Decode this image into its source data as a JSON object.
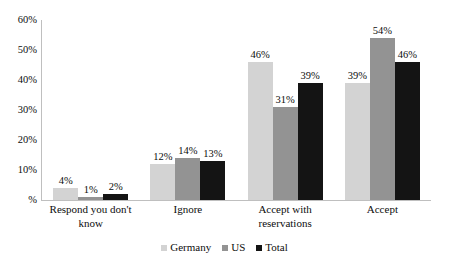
{
  "chart_data": {
    "type": "bar",
    "title": "",
    "subtitle": "",
    "xlabel": "",
    "ylabel": "",
    "ylim": [
      0,
      60
    ],
    "grid": false,
    "legend_position": "bottom",
    "categories": [
      "Respond you don't know",
      "Ignore",
      "Accept with reservations",
      "Accept"
    ],
    "category_lines": [
      [
        "Respond you don't",
        "know"
      ],
      [
        "Ignore"
      ],
      [
        "Accept with",
        "reservations"
      ],
      [
        "Accept"
      ]
    ],
    "y_ticks": [
      "%",
      "10%",
      "20%",
      "30%",
      "40%",
      "50%",
      "60%"
    ],
    "y_tick_values": [
      0,
      10,
      20,
      30,
      40,
      50,
      60
    ],
    "series": [
      {
        "name": "Germany",
        "color": "#d3d3d3",
        "values": [
          4,
          12,
          46,
          39
        ],
        "labels": [
          "4%",
          "12%",
          "46%",
          "39%"
        ]
      },
      {
        "name": "US",
        "color": "#939393",
        "values": [
          1,
          14,
          31,
          54
        ],
        "labels": [
          "1%",
          "14%",
          "31%",
          "54%"
        ]
      },
      {
        "name": "Total",
        "color": "#141414",
        "values": [
          2,
          13,
          39,
          46
        ],
        "labels": [
          "2%",
          "13%",
          "39%",
          "46%"
        ]
      }
    ]
  },
  "legend": {
    "items": [
      {
        "label": "Germany",
        "color": "#d3d3d3"
      },
      {
        "label": "US",
        "color": "#939393"
      },
      {
        "label": "Total",
        "color": "#141414"
      }
    ]
  },
  "axis": {
    "line_color": "#bfbfbf"
  }
}
